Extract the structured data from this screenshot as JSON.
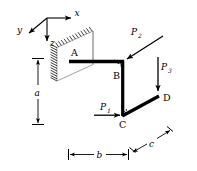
{
  "figure": {
    "background_color": "#ffffff",
    "line_color": "#000000",
    "construction_line_color": "#8a8a8a",
    "axes": {
      "x_label": "x",
      "y_label": "y",
      "z_label": "z",
      "origin_note": "axes triad at upper left",
      "x_direction": "right",
      "y_direction": "lower-left",
      "z_direction": "down"
    },
    "points": [
      {
        "label": "A",
        "note": "fixed end at wall"
      },
      {
        "label": "B",
        "note": "corner between AB and BC"
      },
      {
        "label": "C",
        "note": "corner between BC and CD"
      },
      {
        "label": "D",
        "note": "free end"
      }
    ],
    "loads": [
      {
        "label": "P",
        "subscript": "1",
        "direction": "horizontal right, applied at C"
      },
      {
        "label": "P",
        "subscript": "2",
        "direction": "diagonal down-left, applied at B"
      },
      {
        "label": "P",
        "subscript": "3",
        "direction": "vertical down, applied at D"
      }
    ],
    "dimensions": [
      {
        "label": "a",
        "orientation": "vertical",
        "note": "height from AB level down to C level"
      },
      {
        "label": "b",
        "orientation": "horizontal",
        "note": "length of member AB"
      },
      {
        "label": "c",
        "orientation": "diagonal up-right",
        "note": "length of member CD"
      }
    ],
    "angle_marks": [
      {
        "at": "B",
        "type": "right-angle"
      },
      {
        "at": "C",
        "type": "right-angle"
      }
    ],
    "support": {
      "type": "fixed-wall",
      "hatching": "diagonal hatch along left edge of wall parallelogram"
    }
  }
}
